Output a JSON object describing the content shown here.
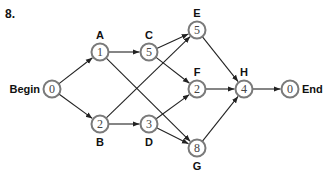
{
  "problem_number": "8.",
  "colors": {
    "node_stroke": "#7a7a7a",
    "edge": "#222222",
    "node_fill": "#ffffff"
  },
  "nodes": [
    {
      "id": "Begin",
      "value": "0",
      "label": "Begin",
      "x": 52,
      "y": 89,
      "label_pos": "left"
    },
    {
      "id": "A",
      "value": "1",
      "label": "A",
      "x": 100,
      "y": 52,
      "label_pos": "above"
    },
    {
      "id": "B",
      "value": "2",
      "label": "B",
      "x": 100,
      "y": 124,
      "label_pos": "below"
    },
    {
      "id": "C",
      "value": "5",
      "label": "C",
      "x": 149,
      "y": 52,
      "label_pos": "above"
    },
    {
      "id": "D",
      "value": "3",
      "label": "D",
      "x": 149,
      "y": 124,
      "label_pos": "below"
    },
    {
      "id": "E",
      "value": "5",
      "label": "E",
      "x": 197,
      "y": 30,
      "label_pos": "above"
    },
    {
      "id": "F",
      "value": "2",
      "label": "F",
      "x": 197,
      "y": 89,
      "label_pos": "above"
    },
    {
      "id": "G",
      "value": "8",
      "label": "G",
      "x": 197,
      "y": 148,
      "label_pos": "below"
    },
    {
      "id": "H",
      "value": "4",
      "label": "H",
      "x": 244,
      "y": 89,
      "label_pos": "above"
    },
    {
      "id": "End",
      "value": "0",
      "label": "End",
      "x": 290,
      "y": 89,
      "label_pos": "right"
    }
  ],
  "edges": [
    [
      "Begin",
      "A"
    ],
    [
      "Begin",
      "B"
    ],
    [
      "A",
      "C"
    ],
    [
      "A",
      "G"
    ],
    [
      "B",
      "E"
    ],
    [
      "B",
      "D"
    ],
    [
      "C",
      "E"
    ],
    [
      "C",
      "F"
    ],
    [
      "D",
      "F"
    ],
    [
      "D",
      "G"
    ],
    [
      "E",
      "H"
    ],
    [
      "F",
      "H"
    ],
    [
      "G",
      "H"
    ],
    [
      "H",
      "End"
    ]
  ]
}
